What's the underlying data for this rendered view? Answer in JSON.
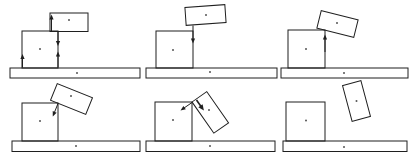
{
  "figure": {
    "width": 419,
    "height": 157,
    "colors": {
      "stroke": "#1f1f1f",
      "dot": "#555555",
      "background": "#ffffff"
    },
    "panels": [
      {
        "id": "plank-flat-on-box",
        "row": 1,
        "col": 1,
        "ground": {
          "x": 10,
          "y": 68,
          "w": 130,
          "h": 10
        },
        "box": {
          "x": 22,
          "y": 31,
          "w": 36,
          "h": 37
        },
        "plank": {
          "cx": 69,
          "cy": 22.25,
          "w": 38,
          "h": 18.5,
          "angle": 0
        },
        "dots": [
          [
            69,
            20
          ],
          [
            40,
            49
          ],
          [
            77,
            73
          ]
        ],
        "arrows": [
          {
            "tail": [
              51.5,
              31.5
            ],
            "tip": [
              51.5,
              14.5
            ],
            "bold": false
          },
          {
            "tail": [
              58,
              32
            ],
            "tip": [
              58,
              46
            ],
            "bold": false
          },
          {
            "tail": [
              58,
              67.5
            ],
            "tip": [
              58,
              51.5
            ],
            "bold": false
          },
          {
            "tail": [
              22.5,
              67.5
            ],
            "tip": [
              22.5,
              54
            ],
            "bold": false
          }
        ]
      },
      {
        "id": "plank-tilted-slightly",
        "row": 1,
        "col": 2,
        "ground": {
          "x": 146,
          "y": 68,
          "w": 131,
          "h": 10
        },
        "box": {
          "x": 156,
          "y": 31,
          "w": 37,
          "h": 37
        },
        "plank": {
          "cx": 205.5,
          "cy": 15,
          "w": 40,
          "h": 18,
          "angle": -4
        },
        "dots": [
          [
            206,
            15
          ],
          [
            173,
            50
          ],
          [
            210,
            72
          ]
        ],
        "arrows": [
          {
            "tail": [
              193,
              25.5
            ],
            "tip": [
              193,
              43.5
            ],
            "bold": false
          }
        ]
      },
      {
        "id": "plank-tipping-on-corner",
        "row": 1,
        "col": 3,
        "ground": {
          "x": 281,
          "y": 68,
          "w": 127,
          "h": 10
        },
        "box": {
          "x": 288,
          "y": 30,
          "w": 37,
          "h": 38
        },
        "plank": {
          "cx": 337.5,
          "cy": 24,
          "w": 38,
          "h": 18,
          "angle": 14
        },
        "dots": [
          [
            337,
            23
          ],
          [
            306,
            49
          ],
          [
            344,
            73
          ]
        ],
        "arrows": [
          {
            "tail": [
              325,
              52
            ],
            "tip": [
              325,
              34.5
            ],
            "bold": false
          }
        ]
      },
      {
        "id": "plank-tipping-more",
        "row": 2,
        "col": 1,
        "ground": {
          "x": 12,
          "y": 141,
          "w": 128,
          "h": 10.5
        },
        "box": {
          "x": 22,
          "y": 103,
          "w": 36,
          "h": 38
        },
        "plank": {
          "cx": 71.5,
          "cy": 99,
          "w": 38,
          "h": 18,
          "angle": 22
        },
        "dots": [
          [
            71,
            96
          ],
          [
            40,
            121
          ],
          [
            76,
            146
          ]
        ],
        "arrows": [
          {
            "tail": [
              58,
              103.5
            ],
            "tip": [
              52.8,
              116.5
            ],
            "bold": false
          }
        ]
      },
      {
        "id": "plank-leaning-steeply",
        "row": 2,
        "col": 2,
        "ground": {
          "x": 146,
          "y": 141,
          "w": 129,
          "h": 10.5
        },
        "box": {
          "x": 155,
          "y": 102,
          "w": 37,
          "h": 39
        },
        "plank": {
          "cx": 210.3,
          "cy": 112.4,
          "w": 38,
          "h": 18,
          "angle": 55
        },
        "dots": [
          [
            209,
            110
          ],
          [
            173,
            120
          ],
          [
            210,
            146
          ]
        ],
        "arrows": [
          {
            "tail": [
              192,
              102.5
            ],
            "tip": [
              180.5,
              110.5
            ],
            "bold": false
          },
          {
            "tail": [
              196.5,
              100
            ],
            "tip": [
              203.9,
              110.6
            ],
            "bold": true
          }
        ]
      },
      {
        "id": "plank-fallen-off",
        "row": 2,
        "col": 3,
        "ground": {
          "x": 283,
          "y": 141,
          "w": 124,
          "h": 10.5
        },
        "box": {
          "x": 286,
          "y": 102,
          "w": 39,
          "h": 39
        },
        "plank": {
          "cx": 356.5,
          "cy": 101,
          "w": 19,
          "h": 37,
          "angle": -15
        },
        "dots": [
          [
            356.5,
            101
          ],
          [
            306,
            120.5
          ],
          [
            344,
            147
          ]
        ],
        "arrows": []
      }
    ]
  }
}
